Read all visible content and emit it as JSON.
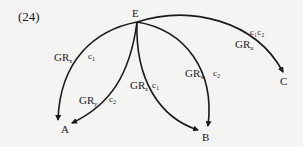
{
  "example_number": "(24)",
  "nodes": {
    "root": "E",
    "a": "A",
    "b": "B",
    "c": "C"
  },
  "edges": [
    {
      "from": "E",
      "to": "A",
      "gr": "GR",
      "gr_sub": "x",
      "c": "c",
      "c_sub": "1"
    },
    {
      "from": "E",
      "to": "A",
      "gr": "GR",
      "gr_sub": "y",
      "c": "c",
      "c_sub": "2"
    },
    {
      "from": "E",
      "to": "B",
      "gr": "GR",
      "gr_sub": "z",
      "c": "c",
      "c_sub": "1"
    },
    {
      "from": "E",
      "to": "B",
      "gr": "GR",
      "gr_sub": "w",
      "c": "c",
      "c_sub": "2"
    },
    {
      "from": "E",
      "to": "C",
      "gr": "GR",
      "gr_sub": "u",
      "c": "c₁c₂",
      "c_sub": ""
    }
  ],
  "colors": {
    "ink": "#1a1a1a",
    "background": "#f4f4f2"
  }
}
